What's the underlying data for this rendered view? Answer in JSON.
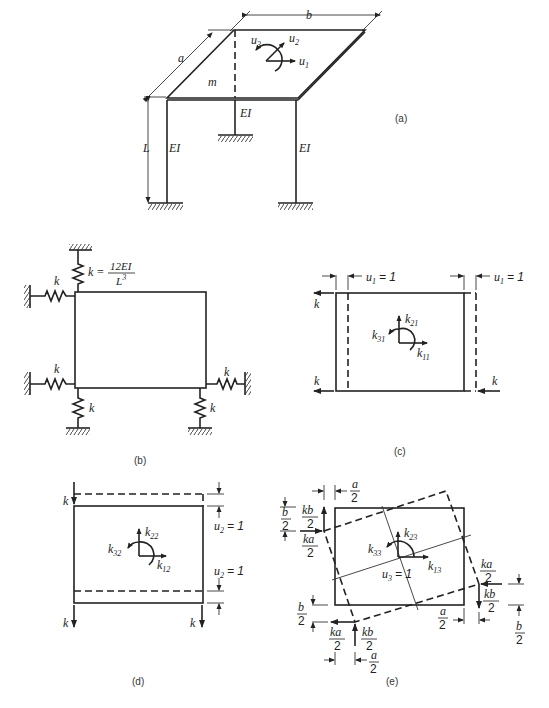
{
  "figure": {
    "panels": [
      {
        "id": "a",
        "label": "(a)",
        "description": "Rigid slab of mass m, dimensions a x b, supported on three columns of length L and stiffness EI; DOFs u1, u2, u3"
      },
      {
        "id": "b",
        "label": "(b)",
        "description": "Plan with equivalent springs k = 12EI/L^3"
      },
      {
        "id": "c",
        "label": "(c)",
        "description": "Unit displacement u1 = 1"
      },
      {
        "id": "d",
        "label": "(d)",
        "description": "Unit displacement u2 = 1"
      },
      {
        "id": "e",
        "label": "(e)",
        "description": "Unit rotation u3 = 1"
      }
    ]
  },
  "panel_a": {
    "label": "(a)",
    "dim_b": "b",
    "dim_a": "a",
    "dim_L": "L",
    "mass": "m",
    "col_left": "EI",
    "col_mid": "EI",
    "col_right": "EI",
    "u1": "u",
    "u1_sub": "1",
    "u2": "u",
    "u2_sub": "2",
    "u3": "u",
    "u3_sub": "3"
  },
  "panel_b": {
    "label": "(b)",
    "k_eq_lhs": "k =",
    "k_eq_num": "12EI",
    "k_eq_den": "L",
    "k_eq_den_sup": "3",
    "spring_label": "k"
  },
  "panel_c": {
    "label": "(c)",
    "disp_left": "u",
    "disp_left_sub": "1",
    "disp_left_val": "= 1",
    "disp_right": "u",
    "disp_right_sub": "1",
    "disp_right_val": "= 1",
    "force": "k",
    "k21": "k",
    "k21_sub": "21",
    "k31": "k",
    "k31_sub": "31",
    "k11": "k",
    "k11_sub": "11"
  },
  "panel_d": {
    "label": "(d)",
    "disp_top": "u",
    "disp_top_sub": "2",
    "disp_top_val": "= 1",
    "disp_bot": "u",
    "disp_bot_sub": "2",
    "disp_bot_val": "= 1",
    "force": "k",
    "k22": "k",
    "k22_sub": "22",
    "k32": "k",
    "k32_sub": "32",
    "k12": "k",
    "k12_sub": "12"
  },
  "panel_e": {
    "label": "(e)",
    "rot": "u",
    "rot_sub": "3",
    "rot_val": "= 1",
    "k23": "k",
    "k23_sub": "23",
    "k33": "k",
    "k33_sub": "33",
    "k13": "k",
    "k13_sub": "13",
    "kb_num": "kb",
    "ka_num": "ka",
    "a_num": "a",
    "b_num": "b",
    "den": "2"
  }
}
